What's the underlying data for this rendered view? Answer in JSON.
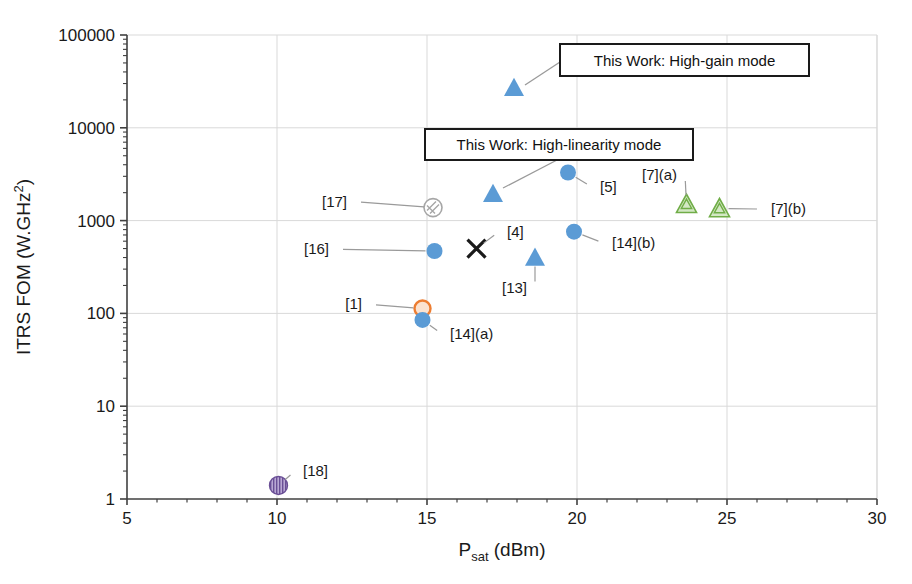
{
  "chart_data": {
    "type": "scatter",
    "title": "",
    "xlabel": "Psat (dBm)",
    "ylabel": "ITRS FOM (W.GHz2)",
    "xlabel_parts": {
      "base": "P",
      "sub": "sat",
      "rest": " (dBm)"
    },
    "ylabel_parts": {
      "base": "ITRS FOM (W.GHz",
      "sup": "2",
      "rest": ")"
    },
    "xlim": [
      5,
      30
    ],
    "ylim": [
      1,
      100000
    ],
    "yscale": "log",
    "xscale": "linear",
    "grid": true,
    "xticks": [
      "5",
      "10",
      "15",
      "20",
      "25",
      "30"
    ],
    "yticks": [
      "1",
      "10",
      "100",
      "1000",
      "10000",
      "100000"
    ],
    "legend_position": "none",
    "points": [
      {
        "label": "This Work: High-gain mode",
        "x": 17.9,
        "y": 27000,
        "marker": "triangle",
        "color": "#5b9bd5",
        "callout": true,
        "label_x": 24.0,
        "label_y": 45000
      },
      {
        "label": "This Work: High-linearity mode",
        "x": 17.2,
        "y": 1950,
        "marker": "triangle",
        "color": "#5b9bd5",
        "callout": true,
        "label_x": 17.6,
        "label_y": 7000
      },
      {
        "label": "[17]",
        "x": 15.2,
        "y": 1380,
        "marker": "circle-hatched",
        "color": "#a6a6a6",
        "label_x": 12.6,
        "label_y": 1600
      },
      {
        "label": "[5]",
        "x": 19.7,
        "y": 3300,
        "marker": "circle",
        "color": "#5b9bd5",
        "label_x": 20.5,
        "label_y": 2300
      },
      {
        "label": "[7](a)",
        "x": 23.65,
        "y": 1500,
        "marker": "triangle-hatched",
        "color": "#70ad47",
        "label_x": 23.6,
        "label_y": 3100
      },
      {
        "label": "[7](b)",
        "x": 24.75,
        "y": 1350,
        "marker": "triangle-hatched",
        "color": "#70ad47",
        "label_x": 26.2,
        "label_y": 1330
      },
      {
        "label": "[16]",
        "x": 15.25,
        "y": 470,
        "marker": "circle",
        "color": "#5b9bd5",
        "label_x": 12.0,
        "label_y": 490
      },
      {
        "label": "[4]",
        "x": 16.65,
        "y": 500,
        "marker": "x",
        "color": "#1a1a1a",
        "label_x": 17.4,
        "label_y": 760
      },
      {
        "label": "[14](b)",
        "x": 19.9,
        "y": 760,
        "marker": "circle",
        "color": "#5b9bd5",
        "label_x": 20.9,
        "label_y": 570
      },
      {
        "label": "[13]",
        "x": 18.6,
        "y": 400,
        "marker": "triangle",
        "color": "#5b9bd5",
        "label_x": 18.6,
        "label_y": 190
      },
      {
        "label": "[1]",
        "x": 14.85,
        "y": 113,
        "marker": "circle-open",
        "color": "#ed7d31",
        "label_x": 13.1,
        "label_y": 125
      },
      {
        "label": "[14](a)",
        "x": 14.85,
        "y": 85,
        "marker": "circle",
        "color": "#5b9bd5",
        "label_x": 15.5,
        "label_y": 60
      },
      {
        "label": "[18]",
        "x": 10.05,
        "y": 1.4,
        "marker": "circle-striped",
        "color": "#8064a2",
        "label_x": 10.6,
        "label_y": 2.0
      }
    ]
  },
  "colors": {
    "blue": "#5b9bd5",
    "green": "#70ad47",
    "orange": "#ed7d31",
    "purple": "#8064a2",
    "grey": "#a6a6a6",
    "black": "#1a1a1a",
    "grid": "#d9d9d9",
    "axis": "#404040"
  },
  "callouts": [
    {
      "text": "This Work: High-gain mode",
      "box": {
        "x": 560,
        "y": 44,
        "w": 249,
        "h": 32
      },
      "leader": {
        "x1": 560,
        "y1": 62,
        "x2": 525,
        "y2": 85
      }
    },
    {
      "text": "This Work: High-linearity mode",
      "box": {
        "x": 425,
        "y": 129,
        "w": 268,
        "h": 31
      },
      "leader": {
        "x1": 557,
        "y1": 160,
        "x2": 503,
        "y2": 188
      }
    }
  ]
}
